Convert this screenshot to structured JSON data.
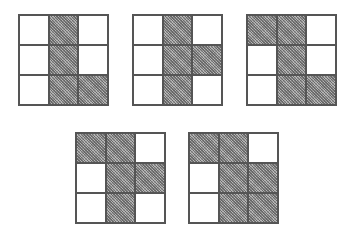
{
  "figure": {
    "colors": {
      "shaded": "#9a9a9a",
      "empty": "#ffffff",
      "border": "#555555"
    },
    "grids": [
      {
        "id": "grid-1",
        "x": 18,
        "y": 14,
        "cells": [
          [
            0,
            1,
            0
          ],
          [
            0,
            1,
            0
          ],
          [
            0,
            1,
            1
          ]
        ]
      },
      {
        "id": "grid-2",
        "x": 132,
        "y": 14,
        "cells": [
          [
            0,
            1,
            0
          ],
          [
            0,
            1,
            1
          ],
          [
            0,
            1,
            0
          ]
        ]
      },
      {
        "id": "grid-3",
        "x": 246,
        "y": 14,
        "cells": [
          [
            1,
            1,
            0
          ],
          [
            0,
            1,
            0
          ],
          [
            0,
            1,
            1
          ]
        ]
      },
      {
        "id": "grid-4",
        "x": 75,
        "y": 132,
        "cells": [
          [
            1,
            1,
            0
          ],
          [
            0,
            1,
            1
          ],
          [
            0,
            1,
            0
          ]
        ]
      },
      {
        "id": "grid-5",
        "x": 188,
        "y": 132,
        "cells": [
          [
            1,
            1,
            0
          ],
          [
            0,
            1,
            1
          ],
          [
            0,
            1,
            1
          ]
        ]
      }
    ]
  }
}
